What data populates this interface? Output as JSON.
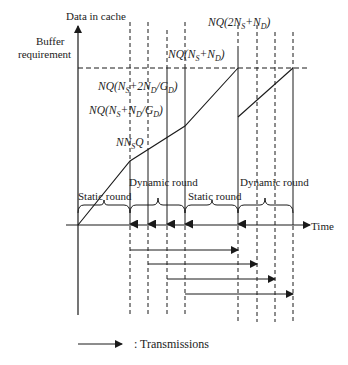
{
  "axes": {
    "y_label": "Data in cache",
    "x_label": "Time"
  },
  "buffer_label": {
    "line1": "Buffer",
    "line2": "requirement"
  },
  "annotations": {
    "nq_2ns_nd": {
      "pre": "NQ(2N",
      "s1": "S",
      "mid": "+N",
      "s2": "D",
      "post": ")"
    },
    "nq_ns_nd": {
      "pre": "NQ(N",
      "s1": "S",
      "mid": "+N",
      "s2": "D",
      "post": ")"
    },
    "nq_ns_2nd_gd": {
      "pre": "NQ(N",
      "s1": "S",
      "mid": "+2N",
      "s2": "D",
      "mid2": "/G",
      "s3": "D",
      "post": ")"
    },
    "nq_ns_nd_gd": {
      "pre": "NQ(N",
      "s1": "S",
      "mid": "+N",
      "s2": "D",
      "mid2": "/G",
      "s3": "D",
      "post": ")"
    },
    "nnsq": {
      "pre": "NN",
      "s1": "S",
      "post": "Q"
    }
  },
  "rounds": [
    {
      "label": "Static round"
    },
    {
      "label": "Dynamic  round"
    },
    {
      "label": "Static round"
    },
    {
      "label": "Dynamic  round"
    }
  ],
  "legend": {
    "label": ": Transmissions"
  },
  "colors": {
    "stroke": "#1a1a1a",
    "text": "#222222",
    "background": "#ffffff"
  }
}
